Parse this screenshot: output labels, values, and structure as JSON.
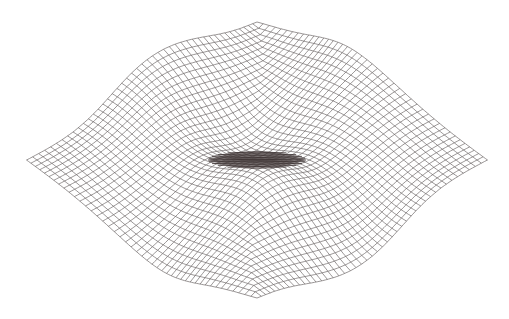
{
  "figure": {
    "type": "wireframe-surface",
    "background": "#ffffff",
    "line_color": "#6e6868",
    "core_color": "#3a3030",
    "line_width": 0.7,
    "grid_lines_per_direction": 44,
    "samples_per_line": 90,
    "center": [
      257,
      160
    ],
    "outline_points": {
      "top_apex": [
        257,
        22
      ],
      "bottom_apex": [
        257,
        298
      ],
      "left_tip": [
        27,
        160
      ],
      "right_tip": [
        488,
        160
      ],
      "left_lobe_top": [
        113,
        87
      ],
      "left_valley_top": [
        150,
        93
      ],
      "right_valley_top": [
        360,
        93
      ],
      "right_lobe_top": [
        393,
        87
      ],
      "left_lobe_bottom": [
        113,
        234
      ],
      "left_valley_bottom": [
        150,
        226
      ],
      "right_valley_bottom": [
        360,
        226
      ],
      "right_lobe_bottom": [
        393,
        234
      ]
    },
    "core_lens": {
      "x0": 208,
      "x1": 306,
      "cy": 160,
      "half_height": 9
    }
  }
}
